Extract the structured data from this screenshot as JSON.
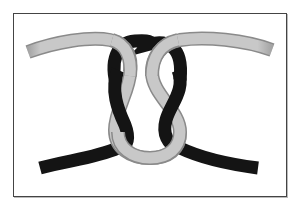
{
  "diagram": {
    "ropes": [
      {
        "name": "light-rope",
        "color": "#c8c8c8",
        "edge_color": "#8a8a8a"
      },
      {
        "name": "dark-rope",
        "color": "#1a1a1a",
        "edge_color": "#000000"
      }
    ],
    "frame": {
      "border_color": "#444444",
      "background": "#ffffff"
    }
  }
}
